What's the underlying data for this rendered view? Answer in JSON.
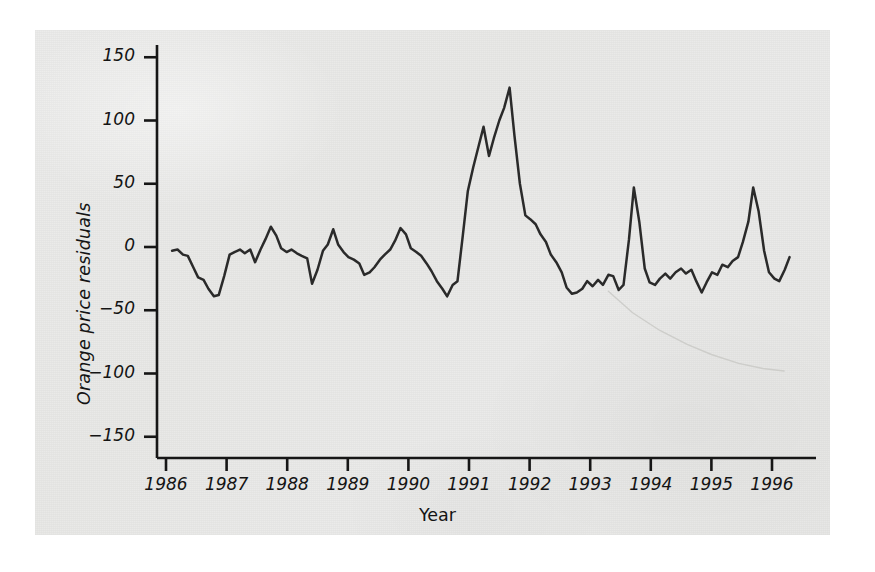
{
  "figure": {
    "background_color": "#ffffff",
    "panel_color": "#e9e9e7",
    "line_color": "#2a2a2a",
    "artifact_color": "#c9c9c6"
  },
  "chart_data": {
    "type": "line",
    "title": "",
    "subtitle": "",
    "xlabel": "Year",
    "ylabel": "Orange price residuals",
    "xlim": [
      1986.0,
      1996.4
    ],
    "ylim": [
      -150,
      150
    ],
    "yticks": [
      150,
      100,
      50,
      0,
      -50,
      -100,
      -150
    ],
    "ytick_labels": [
      "150",
      "100",
      "50",
      "0",
      "-50",
      "-100",
      "-150"
    ],
    "xticks": [
      1986,
      1987,
      1988,
      1989,
      1990,
      1991,
      1992,
      1993,
      1994,
      1995,
      1996
    ],
    "xtick_labels": [
      "1986",
      "1987",
      "1988",
      "1989",
      "1990",
      "1991",
      "1992",
      "1993",
      "1994",
      "1995",
      "1996"
    ],
    "grid": false,
    "legend": "none",
    "series": [
      {
        "name": "Orange price residuals",
        "color": "#2a2a2a",
        "x": [
          1986.1,
          1986.19,
          1986.28,
          1986.36,
          1986.45,
          1986.53,
          1986.62,
          1986.7,
          1986.79,
          1986.87,
          1986.96,
          1987.05,
          1987.13,
          1987.22,
          1987.3,
          1987.39,
          1987.47,
          1987.56,
          1987.64,
          1987.73,
          1987.82,
          1987.9,
          1987.99,
          1988.07,
          1988.16,
          1988.24,
          1988.33,
          1988.41,
          1988.5,
          1988.59,
          1988.67,
          1988.76,
          1988.84,
          1988.93,
          1989.01,
          1989.1,
          1989.19,
          1989.27,
          1989.36,
          1989.44,
          1989.53,
          1989.61,
          1989.7,
          1989.78,
          1989.87,
          1989.96,
          1990.04,
          1990.13,
          1990.21,
          1990.3,
          1990.38,
          1990.47,
          1990.56,
          1990.64,
          1990.73,
          1990.81,
          1990.9,
          1990.98,
          1991.07,
          1991.16,
          1991.24,
          1991.33,
          1991.41,
          1991.5,
          1991.58,
          1991.67,
          1991.75,
          1991.84,
          1991.93,
          1992.01,
          1992.1,
          1992.18,
          1992.27,
          1992.35,
          1992.44,
          1992.53,
          1992.61,
          1992.7,
          1992.78,
          1992.87,
          1992.95,
          1993.04,
          1993.13,
          1993.21,
          1993.3,
          1993.38,
          1993.47,
          1993.55,
          1993.64,
          1993.72,
          1993.81,
          1993.9,
          1993.98,
          1994.07,
          1994.15,
          1994.24,
          1994.32,
          1994.41,
          1994.5,
          1994.58,
          1994.67,
          1994.75,
          1994.84,
          1994.92,
          1995.01,
          1995.1,
          1995.18,
          1995.27,
          1995.35,
          1995.44,
          1995.52,
          1995.61,
          1995.69,
          1995.78,
          1995.87,
          1995.95,
          1996.04,
          1996.12,
          1996.21,
          1996.29
        ],
        "y": [
          -3,
          -2,
          -6,
          -7,
          -16,
          -24,
          -26,
          -33,
          -39,
          -38,
          -23,
          -6,
          -4,
          -2,
          -5,
          -2,
          -12,
          -2,
          6,
          16,
          9,
          -1,
          -4,
          -2,
          -5,
          -7,
          -9,
          -29,
          -18,
          -3,
          2,
          14,
          2,
          -4,
          -8,
          -10,
          -13,
          -22,
          -20,
          -16,
          -10,
          -6,
          -2,
          5,
          15,
          10,
          -1,
          -4,
          -7,
          -13,
          -19,
          -27,
          -33,
          -39,
          -30,
          -27,
          10,
          44,
          63,
          80,
          95,
          72,
          86,
          100,
          110,
          126,
          88,
          50,
          25,
          22,
          18,
          10,
          4,
          -6,
          -12,
          -20,
          -32,
          -37,
          -36,
          -33,
          -27,
          -31,
          -26,
          -30,
          -22,
          -23,
          -34,
          -30,
          6,
          47,
          20,
          -17,
          -28,
          -30,
          -25,
          -21,
          -25,
          -20,
          -17,
          -21,
          -18,
          -27,
          -36,
          -28,
          -20,
          -22,
          -14,
          -16,
          -11,
          -8,
          4,
          20,
          47,
          28,
          -3,
          -20,
          -25,
          -27,
          -18,
          -8
        ]
      }
    ],
    "artifact": {
      "name": "scan-crease",
      "description": "faint light-grey curved crease in lower right of scan",
      "color": "#c9c9c6",
      "x": [
        1993.3,
        1993.7,
        1994.15,
        1994.6,
        1995.0,
        1995.45,
        1995.85,
        1996.2
      ],
      "y": [
        -35,
        -52,
        -66,
        -77,
        -85,
        -92,
        -96,
        -98
      ]
    }
  }
}
